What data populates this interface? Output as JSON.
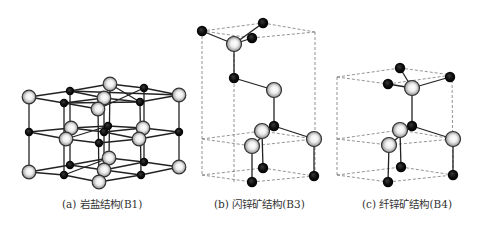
{
  "figure": {
    "panels": [
      {
        "id": "a",
        "caption": "(a) 岩盐结构(B1)",
        "caption_x": 62,
        "structure": "rock-salt",
        "solid_bonds": [
          [
            29,
            97,
            70,
            91
          ],
          [
            70,
            91,
            179,
            95
          ],
          [
            29,
            97,
            64,
            103
          ],
          [
            64,
            103,
            140,
            102
          ],
          [
            140,
            102,
            179,
            95
          ],
          [
            70,
            91,
            110,
            84
          ],
          [
            110,
            84,
            144,
            88
          ],
          [
            144,
            88,
            179,
            95
          ],
          [
            64,
            103,
            104,
            98
          ],
          [
            104,
            98,
            140,
            102
          ],
          [
            70,
            91,
            104,
            98
          ],
          [
            110,
            84,
            140,
            102
          ],
          [
            98,
            109,
            144,
            88
          ],
          [
            64,
            103,
            98,
            109
          ],
          [
            29,
            132,
            71,
            128
          ],
          [
            71,
            128,
            108,
            126
          ],
          [
            108,
            126,
            143,
            128
          ],
          [
            143,
            128,
            179,
            132
          ],
          [
            29,
            132,
            66,
            139
          ],
          [
            66,
            139,
            99,
            143
          ],
          [
            99,
            143,
            139,
            139
          ],
          [
            139,
            139,
            179,
            132
          ],
          [
            71,
            128,
            104,
            132
          ],
          [
            104,
            132,
            143,
            128
          ],
          [
            66,
            139,
            108,
            126
          ],
          [
            104,
            132,
            139,
            139
          ],
          [
            29,
            172,
            70,
            165
          ],
          [
            70,
            165,
            109,
            158
          ],
          [
            109,
            158,
            144,
            162
          ],
          [
            144,
            162,
            179,
            167
          ],
          [
            29,
            172,
            64,
            175
          ],
          [
            64,
            175,
            99,
            182
          ],
          [
            99,
            182,
            141,
            175
          ],
          [
            141,
            175,
            179,
            167
          ],
          [
            70,
            165,
            104,
            170
          ],
          [
            104,
            170,
            141,
            175
          ],
          [
            64,
            175,
            109,
            158
          ],
          [
            104,
            170,
            144,
            162
          ],
          [
            29,
            97,
            29,
            172
          ],
          [
            179,
            95,
            179,
            167
          ],
          [
            64,
            103,
            64,
            175
          ],
          [
            70,
            91,
            70,
            165
          ],
          [
            140,
            102,
            141,
            175
          ],
          [
            144,
            88,
            144,
            162
          ],
          [
            110,
            84,
            109,
            158
          ],
          [
            104,
            98,
            104,
            170
          ],
          [
            98,
            109,
            99,
            182
          ]
        ],
        "dashed_bonds": [],
        "large_atoms": [
          [
            29,
            97
          ],
          [
            110,
            84
          ],
          [
            179,
            95
          ],
          [
            104,
            98
          ],
          [
            98,
            109
          ],
          [
            71,
            128
          ],
          [
            66,
            139
          ],
          [
            143,
            128
          ],
          [
            139,
            139
          ],
          [
            29,
            172
          ],
          [
            109,
            158
          ],
          [
            104,
            170
          ],
          [
            99,
            182
          ],
          [
            179,
            167
          ]
        ],
        "small_atoms": [
          [
            70,
            91
          ],
          [
            144,
            88
          ],
          [
            64,
            103
          ],
          [
            140,
            102
          ],
          [
            29,
            132
          ],
          [
            108,
            126
          ],
          [
            104,
            132
          ],
          [
            99,
            143
          ],
          [
            179,
            132
          ],
          [
            70,
            165
          ],
          [
            144,
            162
          ],
          [
            64,
            175
          ],
          [
            141,
            175
          ]
        ]
      },
      {
        "id": "b",
        "caption": "(b) 闪锌矿结构(B3)",
        "caption_x": 214,
        "structure": "zinc-blende",
        "solid_bonds": [
          [
            202,
            31,
            234,
            44
          ],
          [
            263,
            23,
            234,
            44
          ],
          [
            252,
            38,
            234,
            44
          ],
          [
            234,
            44,
            234,
            78
          ],
          [
            234,
            78,
            274,
            90
          ],
          [
            274,
            90,
            274,
            126
          ],
          [
            274,
            126,
            262,
            131
          ],
          [
            274,
            126,
            314,
            139
          ],
          [
            274,
            126,
            252,
            146
          ],
          [
            262,
            131,
            263,
            168
          ],
          [
            252,
            146,
            252,
            182
          ],
          [
            314,
            139,
            314,
            176
          ]
        ],
        "dashed_bonds": [
          [
            202,
            31,
            263,
            23
          ],
          [
            263,
            23,
            315,
            32
          ],
          [
            202,
            31,
            252,
            38
          ],
          [
            252,
            38,
            315,
            32
          ],
          [
            202,
            31,
            202,
            175
          ],
          [
            315,
            32,
            315,
            176
          ],
          [
            234,
            44,
            234,
            182
          ],
          [
            202,
            139,
            262,
            131
          ],
          [
            262,
            131,
            314,
            139
          ],
          [
            202,
            139,
            252,
            146
          ],
          [
            252,
            146,
            314,
            139
          ],
          [
            202,
            175,
            263,
            168
          ],
          [
            263,
            168,
            314,
            176
          ],
          [
            202,
            175,
            252,
            182
          ],
          [
            252,
            182,
            314,
            176
          ]
        ],
        "large_atoms": [
          [
            234,
            44
          ],
          [
            274,
            90
          ],
          [
            262,
            131
          ],
          [
            252,
            146
          ],
          [
            314,
            139
          ]
        ],
        "small_atoms": [
          [
            202,
            31
          ],
          [
            263,
            23
          ],
          [
            252,
            38
          ],
          [
            234,
            78
          ],
          [
            274,
            126
          ],
          [
            263,
            168
          ],
          [
            252,
            182
          ],
          [
            314,
            176
          ]
        ]
      },
      {
        "id": "c",
        "caption": "(c) 纤锌矿结构(B4)",
        "caption_x": 362,
        "structure": "wurtzite",
        "solid_bonds": [
          [
            400,
            68,
            412,
            88
          ],
          [
            388,
            84,
            412,
            88
          ],
          [
            450,
            77,
            412,
            88
          ],
          [
            412,
            88,
            412,
            126
          ],
          [
            412,
            126,
            400,
            130
          ],
          [
            412,
            126,
            453,
            139
          ],
          [
            412,
            126,
            389,
            145
          ],
          [
            400,
            130,
            401,
            167
          ],
          [
            389,
            145,
            388,
            182
          ],
          [
            453,
            139,
            453,
            175
          ]
        ],
        "dashed_bonds": [
          [
            337,
            77,
            400,
            68
          ],
          [
            400,
            68,
            452,
            75
          ],
          [
            337,
            77,
            388,
            84
          ],
          [
            388,
            84,
            452,
            75
          ],
          [
            337,
            77,
            337,
            175
          ],
          [
            452,
            75,
            453,
            175
          ],
          [
            337,
            139,
            400,
            130
          ],
          [
            400,
            130,
            453,
            139
          ],
          [
            337,
            139,
            389,
            145
          ],
          [
            389,
            145,
            453,
            139
          ],
          [
            337,
            175,
            401,
            167
          ],
          [
            401,
            167,
            453,
            175
          ],
          [
            337,
            175,
            388,
            182
          ],
          [
            388,
            182,
            453,
            175
          ]
        ],
        "large_atoms": [
          [
            412,
            88
          ],
          [
            400,
            130
          ],
          [
            389,
            145
          ],
          [
            453,
            139
          ]
        ],
        "small_atoms": [
          [
            400,
            68
          ],
          [
            450,
            77
          ],
          [
            388,
            84
          ],
          [
            412,
            126
          ],
          [
            401,
            167
          ],
          [
            388,
            182
          ],
          [
            453,
            175
          ]
        ]
      }
    ],
    "legend": {
      "large_atom": "light grey sphere",
      "small_atom": "black sphere"
    },
    "colors": {
      "background": "#ffffff",
      "bond": "#222222",
      "dashed": "#777777",
      "small_atom": "#0a0a0a",
      "large_atom_light": "#ffffff",
      "large_atom_mid": "#cfcfcf",
      "large_atom_edge": "#333333",
      "caption": "#333333"
    }
  }
}
